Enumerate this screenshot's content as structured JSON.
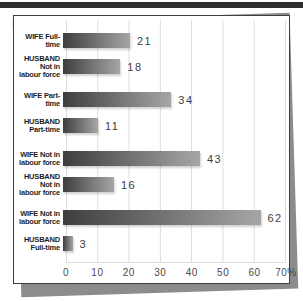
{
  "page": {
    "top_rule_color": "#2d2d2d",
    "sheet_shadow_color": "#8c8c8c",
    "panel_background": "#ffffff",
    "panel_border_color": "#3f3f3f",
    "gridline_color": "#dcdcdc"
  },
  "chart_data": {
    "type": "bar",
    "orientation": "horizontal",
    "title": "",
    "xlabel": "",
    "ylabel": "",
    "xlim": [
      0,
      70
    ],
    "grid": true,
    "categories": [
      "WIFE Full-time",
      "HUSBAND Not in\nlabour force",
      "WIFE Part-time",
      "HUSBAND\nPart-time",
      "WIFE Not in\nlabour force",
      "HUSBAND Not in\nlabour force",
      "WIFE Not in\nlabour force",
      "HUSBAND\nFull-time"
    ],
    "values": [
      21,
      18,
      34,
      11,
      43,
      16,
      62,
      3
    ],
    "value_labels": [
      "21",
      "18",
      "34",
      "11",
      "43",
      "16",
      "62",
      "3"
    ],
    "x_ticks": [
      "0",
      "10",
      "20",
      "30",
      "40",
      "50",
      "60",
      "70%"
    ],
    "group_start_indices": [
      2,
      4,
      6
    ],
    "bar_gradient": [
      "#3e3e3e",
      "#a6a6a6"
    ]
  }
}
